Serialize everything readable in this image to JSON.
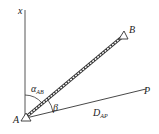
{
  "diagram": {
    "type": "surveying-polar-coordinate-layout",
    "axis": {
      "label": "x"
    },
    "points": {
      "A": {
        "label": "A",
        "marker": "triangle"
      },
      "B": {
        "label": "B",
        "marker": "triangle"
      },
      "P": {
        "label": "P"
      }
    },
    "angles": {
      "azimuth": {
        "symbol": "α",
        "subscript": "AB"
      },
      "beta": {
        "symbol": "β"
      }
    },
    "distance": {
      "symbol": "D",
      "subscript": "AP"
    },
    "colors": {
      "line": "#333333",
      "background": "#ffffff"
    }
  }
}
